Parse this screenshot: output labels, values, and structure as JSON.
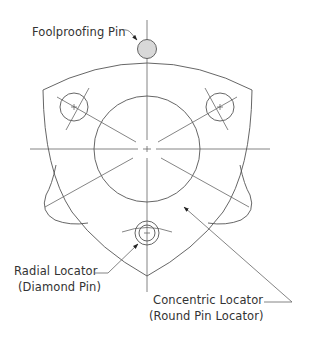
{
  "diagram": {
    "type": "fixture-locating-diagram",
    "colors": {
      "background": "#ffffff",
      "line": "#555555",
      "pin_fill": "#d8d8d8",
      "text": "#333333"
    },
    "labels": {
      "foolproofing_pin": "Foolproofing Pin",
      "radial_locator_line1": "Radial Locator",
      "radial_locator_line2": "(Diamond Pin)",
      "concentric_locator_line1": "Concentric Locator",
      "concentric_locator_line2": "(Round Pin Locator)"
    },
    "components": [
      {
        "name": "Foolproofing Pin",
        "shape": "circle",
        "filled": true
      },
      {
        "name": "Radial Locator",
        "detail": "Diamond Pin"
      },
      {
        "name": "Concentric Locator",
        "detail": "Round Pin Locator"
      },
      {
        "name": "Workpiece",
        "shape": "three-lobed part with central bore and two bolt holes"
      }
    ]
  }
}
